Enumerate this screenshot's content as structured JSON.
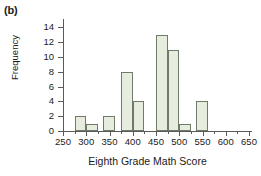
{
  "panel": {
    "label": "(b)"
  },
  "chart_data": {
    "type": "bar",
    "title": "",
    "xlabel": "Eighth Grade Math Score",
    "ylabel": "Frequency",
    "xlim": [
      250,
      650
    ],
    "ylim": [
      0,
      15
    ],
    "grid": false,
    "legend": null,
    "bin_width": 25,
    "xticks": [
      250,
      300,
      350,
      400,
      450,
      500,
      550,
      600,
      650
    ],
    "xtick_labels": [
      "250",
      "300",
      "350",
      "400",
      "450",
      "500",
      "550",
      "600",
      "650"
    ],
    "yticks": [
      0,
      2,
      4,
      6,
      8,
      10,
      12,
      14
    ],
    "ytick_labels": [
      "0",
      "2",
      "4",
      "6",
      "8",
      "10",
      "12",
      "14"
    ],
    "bar_color": "#e6edde",
    "bar_edge_color": "#6f7b68",
    "axis_color": "#5a5a5a",
    "bins": [
      {
        "start": 275,
        "end": 300,
        "value": 2
      },
      {
        "start": 300,
        "end": 325,
        "value": 1
      },
      {
        "start": 337,
        "end": 362,
        "value": 2
      },
      {
        "start": 375,
        "end": 400,
        "value": 8
      },
      {
        "start": 400,
        "end": 425,
        "value": 4
      },
      {
        "start": 450,
        "end": 475,
        "value": 13
      },
      {
        "start": 475,
        "end": 500,
        "value": 11
      },
      {
        "start": 500,
        "end": 525,
        "value": 1
      },
      {
        "start": 537,
        "end": 562,
        "value": 4
      }
    ],
    "categories": [
      "275-300",
      "300-325",
      "337-362",
      "375-400",
      "400-425",
      "450-475",
      "475-500",
      "500-525",
      "537-562"
    ],
    "values": [
      2,
      1,
      2,
      8,
      4,
      13,
      11,
      1,
      4
    ]
  }
}
